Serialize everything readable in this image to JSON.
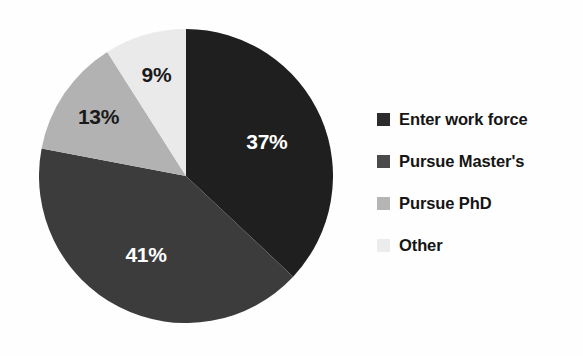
{
  "chart_data": {
    "type": "pie",
    "title": "",
    "subtitle": "",
    "xlabel": "",
    "ylabel": "",
    "grid": false,
    "legend_position": "right",
    "start_angle_deg": 0,
    "direction": "clockwise",
    "categories": [
      "Enter work force",
      "Pursue Master's",
      "Pursue PhD",
      "Other"
    ],
    "values": [
      37,
      41,
      13,
      9
    ],
    "value_unit": "%",
    "data_labels": [
      "37%",
      "41%",
      "13%",
      "9%"
    ],
    "colors": [
      "#1f1f1f",
      "#3c3c3c",
      "#b2b2b2",
      "#eaeaea"
    ],
    "slices": [
      {
        "label": "Enter work force",
        "value": 37,
        "data_label": "37%",
        "color": "#1f1f1f",
        "label_color": "#ffffff",
        "start_angle_deg": 0,
        "end_angle_deg": 133.2
      },
      {
        "label": "Pursue Master's",
        "value": 41,
        "data_label": "41%",
        "color": "#3c3c3c",
        "label_color": "#ffffff",
        "start_angle_deg": 133.2,
        "end_angle_deg": 280.8
      },
      {
        "label": "Pursue PhD",
        "value": 13,
        "data_label": "13%",
        "color": "#b2b2b2",
        "label_color": "#1a1a1a",
        "start_angle_deg": 280.8,
        "end_angle_deg": 327.6
      },
      {
        "label": "Other",
        "value": 9,
        "data_label": "9%",
        "color": "#eaeaea",
        "label_color": "#1a1a1a",
        "start_angle_deg": 327.6,
        "end_angle_deg": 360
      }
    ]
  },
  "legend": {
    "items": [
      {
        "label": "Enter work force",
        "color": "#2c2c2c"
      },
      {
        "label": "Pursue Master's",
        "color": "#4a4a4a"
      },
      {
        "label": "Pursue PhD",
        "color": "#b5b5b5"
      },
      {
        "label": "Other",
        "color": "#ececec"
      }
    ]
  }
}
